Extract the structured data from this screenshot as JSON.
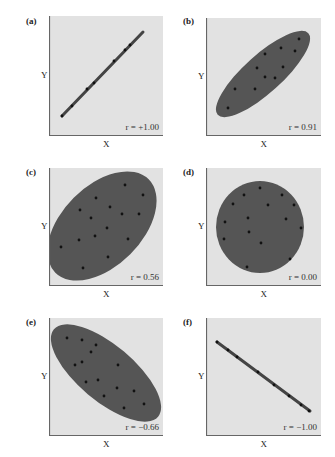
{
  "colors": {
    "panel_bg": "#e2e2e2",
    "axis": "#666666",
    "ellipse_fill": "#555555",
    "point": "#111111",
    "line": "#444444"
  },
  "axes": {
    "xlabel": "X",
    "ylabel": "Y"
  },
  "chart_data": [
    {
      "type": "scatter",
      "panel": "(a)",
      "label": "r = +1.00",
      "r": 1.0,
      "xlabel": "X",
      "ylabel": "Y",
      "grid": false,
      "shape": "line",
      "line": [
        [
          13,
          100
        ],
        [
          94,
          16
        ]
      ],
      "points": [
        [
          13,
          100
        ],
        [
          23,
          90
        ],
        [
          38,
          73
        ],
        [
          45,
          67
        ],
        [
          65,
          45
        ],
        [
          76,
          34
        ],
        [
          81,
          29
        ]
      ]
    },
    {
      "type": "scatter",
      "panel": "(b)",
      "label": "r = 0.91",
      "r": 0.91,
      "xlabel": "X",
      "ylabel": "Y",
      "grid": false,
      "shape": "ellipse",
      "ellipse": {
        "cx": 57,
        "cy": 56,
        "rx": 61,
        "ry": 19,
        "rotate": -42
      },
      "points": [
        [
          93,
          21
        ],
        [
          75,
          30
        ],
        [
          89,
          33
        ],
        [
          59,
          36
        ],
        [
          51,
          50
        ],
        [
          77,
          49
        ],
        [
          59,
          59
        ],
        [
          69,
          60
        ],
        [
          29,
          71
        ],
        [
          49,
          71
        ],
        [
          22,
          90
        ]
      ]
    },
    {
      "type": "scatter",
      "panel": "(c)",
      "label": "r = 0.56",
      "r": 0.56,
      "xlabel": "X",
      "ylabel": "Y",
      "grid": false,
      "shape": "ellipse",
      "ellipse": {
        "cx": 53,
        "cy": 58,
        "rx": 66,
        "ry": 40,
        "rotate": -45
      },
      "points": [
        [
          76,
          17
        ],
        [
          94,
          27
        ],
        [
          47,
          30
        ],
        [
          31,
          42
        ],
        [
          61,
          39
        ],
        [
          73,
          46
        ],
        [
          90,
          46
        ],
        [
          42,
          50
        ],
        [
          58,
          60
        ],
        [
          46,
          68
        ],
        [
          30,
          72
        ],
        [
          79,
          71
        ],
        [
          12,
          79
        ],
        [
          59,
          89
        ],
        [
          34,
          100
        ]
      ]
    },
    {
      "type": "scatter",
      "panel": "(d)",
      "label": "r = 0.00",
      "r": 0.0,
      "xlabel": "X",
      "ylabel": "Y",
      "grid": false,
      "shape": "ellipse",
      "ellipse": {
        "cx": 54,
        "cy": 59,
        "rx": 44,
        "ry": 46,
        "rotate": 0
      },
      "points": [
        [
          54,
          20
        ],
        [
          38,
          27
        ],
        [
          76,
          27
        ],
        [
          27,
          36
        ],
        [
          62,
          37
        ],
        [
          88,
          37
        ],
        [
          19,
          54
        ],
        [
          42,
          50
        ],
        [
          80,
          51
        ],
        [
          95,
          60
        ],
        [
          43,
          64
        ],
        [
          18,
          71
        ],
        [
          55,
          75
        ],
        [
          84,
          91
        ],
        [
          41,
          99
        ]
      ]
    },
    {
      "type": "scatter",
      "panel": "(e)",
      "label": "r = −0.66",
      "r": -0.66,
      "xlabel": "X",
      "ylabel": "Y",
      "grid": false,
      "shape": "ellipse",
      "ellipse": {
        "cx": 57,
        "cy": 55,
        "rx": 68,
        "ry": 28,
        "rotate": 40
      },
      "points": [
        [
          18,
          20
        ],
        [
          33,
          22
        ],
        [
          47,
          27
        ],
        [
          42,
          34
        ],
        [
          33,
          44
        ],
        [
          26,
          47
        ],
        [
          69,
          47
        ],
        [
          49,
          62
        ],
        [
          37,
          64
        ],
        [
          68,
          70
        ],
        [
          85,
          73
        ],
        [
          55,
          78
        ],
        [
          95,
          86
        ],
        [
          75,
          90
        ]
      ]
    },
    {
      "type": "scatter",
      "panel": "(f)",
      "label": "r = −1.00",
      "r": -1.0,
      "xlabel": "X",
      "ylabel": "Y",
      "grid": false,
      "shape": "line",
      "line": [
        [
          11,
          24
        ],
        [
          104,
          93
        ]
      ],
      "points": [
        [
          11,
          24
        ],
        [
          22,
          32
        ],
        [
          31,
          39
        ],
        [
          52,
          54
        ],
        [
          68,
          67
        ],
        [
          83,
          78
        ],
        [
          95,
          87
        ],
        [
          103,
          93
        ]
      ]
    }
  ],
  "layout": {
    "panels": [
      {
        "tag_x": 26,
        "tag_y": 16,
        "box_x": 49,
        "box_y": 16,
        "w": 114,
        "h": 120
      },
      {
        "tag_x": 183,
        "tag_y": 16,
        "box_x": 206,
        "box_y": 18,
        "w": 115,
        "h": 118
      },
      {
        "tag_x": 26,
        "tag_y": 167,
        "box_x": 49,
        "box_y": 168,
        "w": 114,
        "h": 118
      },
      {
        "tag_x": 183,
        "tag_y": 167,
        "box_x": 206,
        "box_y": 168,
        "w": 115,
        "h": 118
      },
      {
        "tag_x": 26,
        "tag_y": 317,
        "box_x": 49,
        "box_y": 318,
        "w": 114,
        "h": 118
      },
      {
        "tag_x": 183,
        "tag_y": 317,
        "box_x": 206,
        "box_y": 318,
        "w": 115,
        "h": 118
      }
    ]
  }
}
